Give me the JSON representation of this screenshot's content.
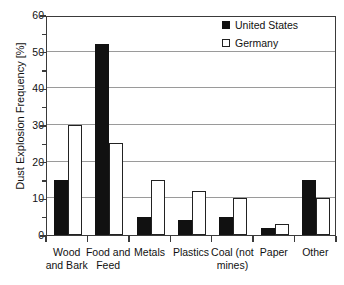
{
  "chart_data": {
    "type": "bar",
    "title": "",
    "xlabel": "",
    "ylabel": "Dust Explosion Frequency [%]",
    "ylim": [
      0,
      60
    ],
    "ytick_major_step": 10,
    "ytick_minor_step": 5,
    "yticks": [
      0,
      10,
      20,
      30,
      40,
      50,
      60
    ],
    "ytick_labels": [
      "0",
      "10",
      "20",
      "30",
      "40",
      "50",
      "60"
    ],
    "grid": "horizontal-major",
    "legend_position": "top-right",
    "categories": [
      "Wood and Bark",
      "Food and Feed",
      "Metals",
      "Plastics",
      "Coal (not mines)",
      "Paper",
      "Other"
    ],
    "category_lines": [
      [
        "Wood",
        "and Bark"
      ],
      [
        "Food and",
        "Feed"
      ],
      [
        "Metals",
        ""
      ],
      [
        "Plastics",
        ""
      ],
      [
        "Coal (not",
        "mines)"
      ],
      [
        "Paper",
        ""
      ],
      [
        "Other",
        ""
      ]
    ],
    "series": [
      {
        "name": "United States",
        "color": "#111111",
        "style": "filled",
        "values": [
          15,
          52,
          5,
          4,
          5,
          2,
          15
        ]
      },
      {
        "name": "Germany",
        "color": "#ffffff",
        "style": "hollow",
        "values": [
          30,
          25,
          15,
          12,
          10,
          3,
          10
        ]
      }
    ]
  },
  "legend": {
    "items": [
      {
        "label": "United States",
        "swatch": "filled-square-icon"
      },
      {
        "label": "Germany",
        "swatch": "hollow-square-icon"
      }
    ]
  }
}
